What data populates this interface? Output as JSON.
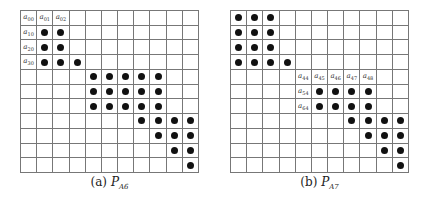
{
  "figures": [
    {
      "id": "a",
      "caption_prefix": "(a)",
      "caption_symbol": "P",
      "caption_subscript": "A6",
      "rows": 11,
      "cols": 11,
      "labels": [
        {
          "r": 0,
          "c": 0,
          "base": "a",
          "sub": "00"
        },
        {
          "r": 0,
          "c": 1,
          "base": "a",
          "sub": "01"
        },
        {
          "r": 0,
          "c": 2,
          "base": "a",
          "sub": "02"
        },
        {
          "r": 1,
          "c": 0,
          "base": "a",
          "sub": "10"
        },
        {
          "r": 2,
          "c": 0,
          "base": "a",
          "sub": "20"
        },
        {
          "r": 3,
          "c": 0,
          "base": "a",
          "sub": "30"
        }
      ],
      "dots": [
        [
          1,
          1
        ],
        [
          1,
          2
        ],
        [
          2,
          1
        ],
        [
          2,
          2
        ],
        [
          3,
          1
        ],
        [
          3,
          2
        ],
        [
          3,
          3
        ],
        [
          4,
          4
        ],
        [
          4,
          5
        ],
        [
          4,
          6
        ],
        [
          4,
          7
        ],
        [
          4,
          8
        ],
        [
          5,
          4
        ],
        [
          5,
          5
        ],
        [
          5,
          6
        ],
        [
          5,
          7
        ],
        [
          5,
          8
        ],
        [
          6,
          4
        ],
        [
          6,
          5
        ],
        [
          6,
          6
        ],
        [
          6,
          7
        ],
        [
          6,
          8
        ],
        [
          7,
          7
        ],
        [
          7,
          8
        ],
        [
          7,
          9
        ],
        [
          7,
          10
        ],
        [
          8,
          8
        ],
        [
          8,
          9
        ],
        [
          8,
          10
        ],
        [
          9,
          9
        ],
        [
          9,
          10
        ],
        [
          10,
          10
        ]
      ]
    },
    {
      "id": "b",
      "caption_prefix": "(b)",
      "caption_symbol": "P",
      "caption_subscript": "A7",
      "rows": 11,
      "cols": 11,
      "labels": [
        {
          "r": 4,
          "c": 4,
          "base": "a",
          "sub": "44"
        },
        {
          "r": 4,
          "c": 5,
          "base": "a",
          "sub": "45"
        },
        {
          "r": 4,
          "c": 6,
          "base": "a",
          "sub": "46"
        },
        {
          "r": 4,
          "c": 7,
          "base": "a",
          "sub": "47"
        },
        {
          "r": 4,
          "c": 8,
          "base": "a",
          "sub": "48"
        },
        {
          "r": 5,
          "c": 4,
          "base": "a",
          "sub": "54"
        },
        {
          "r": 6,
          "c": 4,
          "base": "a",
          "sub": "64"
        }
      ],
      "dots": [
        [
          0,
          0
        ],
        [
          0,
          1
        ],
        [
          0,
          2
        ],
        [
          1,
          0
        ],
        [
          1,
          1
        ],
        [
          1,
          2
        ],
        [
          2,
          0
        ],
        [
          2,
          1
        ],
        [
          2,
          2
        ],
        [
          3,
          0
        ],
        [
          3,
          1
        ],
        [
          3,
          2
        ],
        [
          3,
          3
        ],
        [
          5,
          5
        ],
        [
          5,
          6
        ],
        [
          5,
          7
        ],
        [
          5,
          8
        ],
        [
          6,
          5
        ],
        [
          6,
          6
        ],
        [
          6,
          7
        ],
        [
          6,
          8
        ],
        [
          7,
          7
        ],
        [
          7,
          8
        ],
        [
          7,
          9
        ],
        [
          7,
          10
        ],
        [
          8,
          8
        ],
        [
          8,
          9
        ],
        [
          8,
          10
        ],
        [
          9,
          9
        ],
        [
          9,
          10
        ],
        [
          10,
          10
        ]
      ]
    }
  ]
}
